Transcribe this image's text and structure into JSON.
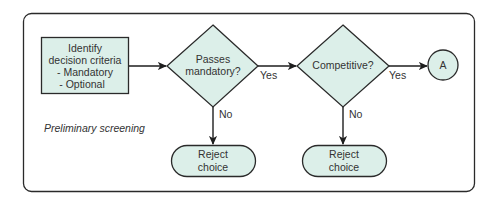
{
  "diagram": {
    "title": "Preliminary screening",
    "colors": {
      "node_fill": "#dcefe9",
      "stroke": "#2a2a2a",
      "text": "#333333"
    },
    "nodes": {
      "criteria": {
        "type": "process",
        "lines": [
          "Identify",
          "decision criteria",
          "- Mandatory",
          "- Optional"
        ]
      },
      "mandatory": {
        "type": "decision",
        "lines": [
          "Passes",
          "mandatory?"
        ]
      },
      "competitive": {
        "type": "decision",
        "lines": [
          "Competitive?"
        ]
      },
      "connector": {
        "type": "connector",
        "label": "A"
      },
      "reject1": {
        "type": "terminal",
        "lines": [
          "Reject",
          "choice"
        ]
      },
      "reject2": {
        "type": "terminal",
        "lines": [
          "Reject",
          "choice"
        ]
      }
    },
    "edges": [
      {
        "from": "criteria",
        "to": "mandatory",
        "label": ""
      },
      {
        "from": "mandatory",
        "to": "competitive",
        "label": "Yes"
      },
      {
        "from": "competitive",
        "to": "connector",
        "label": "Yes"
      },
      {
        "from": "mandatory",
        "to": "reject1",
        "label": "No"
      },
      {
        "from": "competitive",
        "to": "reject2",
        "label": "No"
      }
    ]
  }
}
